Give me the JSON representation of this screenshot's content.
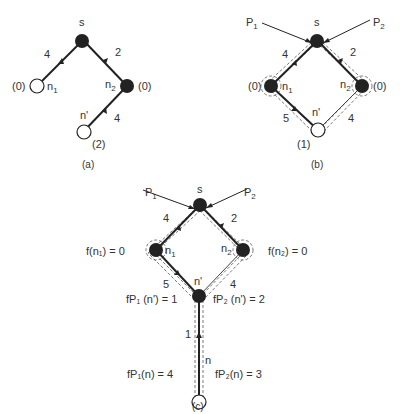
{
  "diagrams": [
    {
      "id": "a",
      "caption": "(a)",
      "nodes": {
        "s": {
          "label": "s",
          "filled": true
        },
        "n1": {
          "label": "n",
          "sub": "1",
          "value": "(0)",
          "filled": false
        },
        "n2": {
          "label": "n",
          "sub": "2",
          "value": "(0)",
          "filled": true
        },
        "nprime": {
          "label": "n'",
          "value": "(2)",
          "filled": false
        }
      },
      "edges": [
        {
          "from": "n1",
          "to": "s",
          "cost": "4"
        },
        {
          "from": "n2",
          "to": "s",
          "cost": "2"
        },
        {
          "from": "nprime",
          "to": "n2",
          "cost": "4"
        }
      ]
    },
    {
      "id": "b",
      "caption": "(b)",
      "pointers": [
        "P",
        "P"
      ],
      "pointer_subs": [
        "1",
        "2"
      ],
      "nodes": {
        "s": {
          "label": "s",
          "filled": true
        },
        "n1": {
          "label": "n",
          "sub": "1",
          "value": "(0)",
          "filled": true
        },
        "n2": {
          "label": "n",
          "sub": "2",
          "value": "(0)",
          "filled": true
        },
        "nprime": {
          "label": "n'",
          "value": "(1)",
          "filled": false
        }
      },
      "edges": [
        {
          "from": "n1",
          "to": "s",
          "cost": "4"
        },
        {
          "from": "n2",
          "to": "s",
          "cost": "2"
        },
        {
          "from": "nprime",
          "to": "n1",
          "cost": "5"
        },
        {
          "from": "nprime",
          "to": "n2",
          "cost": "4"
        }
      ]
    },
    {
      "id": "c",
      "caption": "(c)",
      "pointers": [
        "P",
        "P"
      ],
      "pointer_subs": [
        "1",
        "2"
      ],
      "nodes": {
        "s": {
          "label": "s",
          "filled": true
        },
        "n1": {
          "label": "n",
          "sub": "1",
          "filled": true
        },
        "n2": {
          "label": "n",
          "sub": "2",
          "filled": true
        },
        "nprime": {
          "label": "n'",
          "filled": true
        },
        "n": {
          "label": "n",
          "filled": false
        }
      },
      "edges": [
        {
          "from": "n1",
          "to": "s",
          "cost": "4"
        },
        {
          "from": "n2",
          "to": "s",
          "cost": "2"
        },
        {
          "from": "nprime",
          "to": "n1",
          "cost": "5"
        },
        {
          "from": "nprime",
          "to": "n2",
          "cost": "4"
        },
        {
          "from": "n",
          "to": "nprime",
          "cost": "1"
        }
      ],
      "annotations": {
        "f_n1": "f(n₁) = 0",
        "f_n2": "f(n₂) = 0",
        "fp1_nprime": "fP₁ (n') = 1",
        "fp2_nprime": "fP₂ (n') = 2",
        "fp1_n": "fP₁(n) = 4",
        "fp2_n": "fP₂(n) = 3"
      }
    }
  ]
}
